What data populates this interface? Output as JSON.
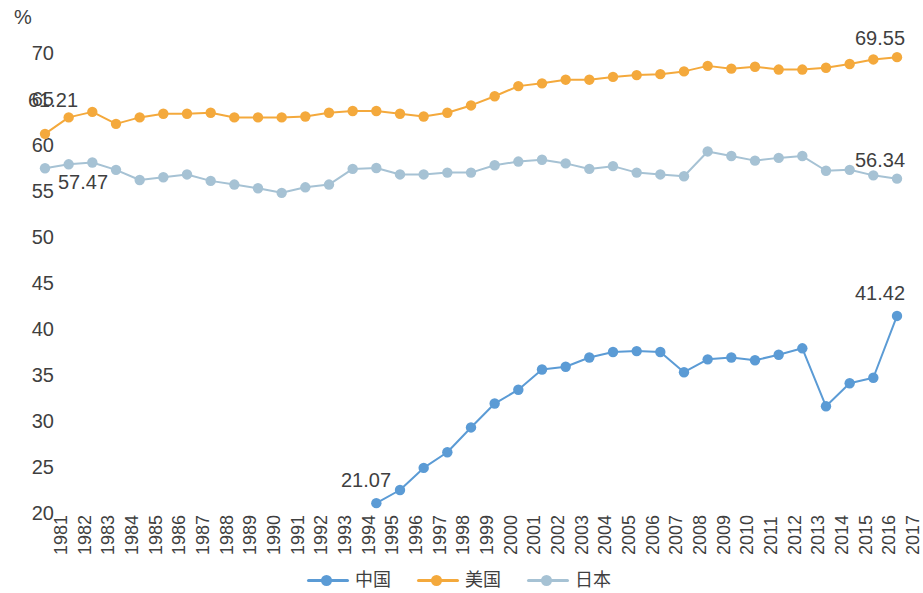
{
  "chart_data": {
    "type": "line",
    "title": "",
    "xlabel": "",
    "ylabel": "%",
    "ylim": [
      20,
      70
    ],
    "yticks": [
      20,
      25,
      30,
      35,
      40,
      45,
      50,
      55,
      60,
      65,
      70
    ],
    "grid": false,
    "legend_position": "bottom",
    "categories": [
      "1981",
      "1982",
      "1983",
      "1984",
      "1985",
      "1986",
      "1987",
      "1988",
      "1989",
      "1990",
      "1991",
      "1992",
      "1993",
      "1994",
      "1995",
      "1996",
      "1997",
      "1998",
      "1999",
      "2000",
      "2001",
      "2002",
      "2003",
      "2004",
      "2005",
      "2006",
      "2007",
      "2008",
      "2009",
      "2010",
      "2011",
      "2012",
      "2013",
      "2014",
      "2015",
      "2016",
      "2017"
    ],
    "series": [
      {
        "name": "中国",
        "color": "#5b9bd5",
        "values": [
          null,
          null,
          null,
          null,
          null,
          null,
          null,
          null,
          null,
          null,
          null,
          null,
          null,
          null,
          21.07,
          22.5,
          24.9,
          26.6,
          29.3,
          31.9,
          33.4,
          35.6,
          35.9,
          36.9,
          37.5,
          37.6,
          37.5,
          35.3,
          36.7,
          36.9,
          36.6,
          37.2,
          37.9,
          31.6,
          34.1,
          34.7,
          41.42
        ]
      },
      {
        "name": "美国",
        "color": "#f4a93c",
        "values": [
          61.21,
          63.0,
          63.6,
          62.3,
          63.0,
          63.4,
          63.4,
          63.5,
          63.0,
          63.0,
          63.0,
          63.1,
          63.5,
          63.7,
          63.7,
          63.4,
          63.1,
          63.5,
          64.3,
          65.3,
          66.4,
          66.7,
          67.1,
          67.1,
          67.4,
          67.6,
          67.7,
          68.0,
          68.6,
          68.3,
          68.5,
          68.2,
          68.2,
          68.4,
          68.8,
          69.3,
          69.55
        ]
      },
      {
        "name": "日本",
        "color": "#a6c2d4",
        "values": [
          57.47,
          57.9,
          58.1,
          57.3,
          56.2,
          56.5,
          56.8,
          56.1,
          55.7,
          55.3,
          54.8,
          55.4,
          55.7,
          57.4,
          57.5,
          56.8,
          56.8,
          57.0,
          57.0,
          57.8,
          58.2,
          58.4,
          58.0,
          57.4,
          57.7,
          57.0,
          56.8,
          56.6,
          59.3,
          58.8,
          58.3,
          58.6,
          58.8,
          57.2,
          57.3,
          56.7,
          56.34
        ]
      }
    ],
    "point_labels": [
      {
        "text": "61.21",
        "series": "美国",
        "year": "1981",
        "x": 28,
        "y": 90
      },
      {
        "text": "57.47",
        "series": "日本",
        "year": "1981",
        "x": 58,
        "y": 172
      },
      {
        "text": "21.07",
        "series": "中国",
        "year": "1995",
        "x": 341,
        "y": 470
      },
      {
        "text": "69.55",
        "series": "美国",
        "year": "2017",
        "x": 855,
        "y": 28
      },
      {
        "text": "56.34",
        "series": "日本",
        "year": "2017",
        "x": 855,
        "y": 150
      },
      {
        "text": "41.42",
        "series": "中国",
        "year": "2017",
        "x": 855,
        "y": 283
      }
    ]
  },
  "axis": {
    "unit": "%",
    "ytick_labels": [
      "70",
      "65",
      "60",
      "55",
      "50",
      "45",
      "40",
      "35",
      "30",
      "25",
      "20"
    ]
  },
  "legend": {
    "items": [
      {
        "label": "中国",
        "color": "#5b9bd5"
      },
      {
        "label": "美国",
        "color": "#f4a93c"
      },
      {
        "label": "日本",
        "color": "#a6c2d4"
      }
    ]
  }
}
